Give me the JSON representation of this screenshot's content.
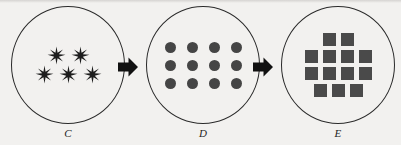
{
  "figure": {
    "background_color": "#f2f1ef",
    "ink_color": "#1d1d1d",
    "panels": [
      {
        "label": "C",
        "shape_name": "six-pointed-star",
        "shape_color": "#1d1d1d",
        "total_count": 5,
        "rows": [
          2,
          3
        ]
      },
      {
        "label": "D",
        "shape_name": "filled-circle-dot",
        "shape_color": "#454545",
        "total_count": 12,
        "rows": [
          4,
          4,
          4
        ]
      },
      {
        "label": "E",
        "shape_name": "filled-square",
        "shape_color": "#4a4a4a",
        "total_count": 13,
        "rows": [
          2,
          4,
          4,
          3
        ]
      }
    ],
    "arrows": [
      {
        "name": "arrow-c-to-d",
        "direction": "right",
        "color": "#111111"
      },
      {
        "name": "arrow-d-to-e",
        "direction": "right",
        "color": "#111111"
      }
    ]
  }
}
